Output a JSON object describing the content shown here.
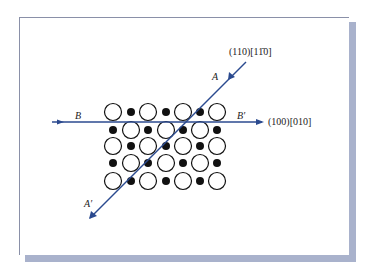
{
  "figure": {
    "panel_colors": {
      "shadow": "#a9b2cc",
      "line": "#2b4a8f",
      "atom_fill_small": "#111111",
      "atom_stroke_large": "#111111"
    },
    "labels": {
      "A": "A",
      "A_prime": "A′",
      "B": "B",
      "B_prime": "B′",
      "diagonal_system": "(110)[11̄0]",
      "horizontal_system": "(100)[010]"
    },
    "lattice": {
      "rows_y": [
        112,
        130,
        146,
        163,
        181
      ],
      "cols_x": [
        113,
        131,
        148,
        166,
        183,
        200,
        217
      ],
      "pattern": [
        [
          "L",
          "S",
          "L",
          "S",
          "L",
          "S",
          "L"
        ],
        [
          "S",
          "L",
          "S",
          "L",
          "S",
          "L",
          "S"
        ],
        [
          "L",
          "S",
          "L",
          "S",
          "L",
          "S",
          "L"
        ],
        [
          "S",
          "L",
          "S",
          "L",
          "S",
          "L",
          "S"
        ],
        [
          "L",
          "S",
          "L",
          "S",
          "L",
          "S",
          "L"
        ]
      ],
      "large_radius": 8.5,
      "small_radius": 4
    },
    "lines": {
      "horizontal": {
        "x1": 52,
        "y1": 122,
        "x2": 262,
        "y2": 122
      },
      "diagonal": {
        "x1": 246,
        "y1": 62,
        "x2": 90,
        "y2": 218
      }
    }
  }
}
